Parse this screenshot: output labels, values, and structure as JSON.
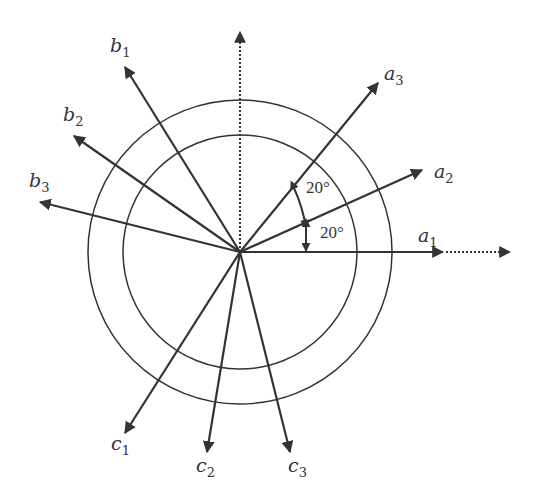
{
  "diagram": {
    "center": [
      240,
      252
    ],
    "circles": {
      "outer_radius": 152,
      "inner_radius": 117
    },
    "reference_axis_vertical": {
      "style": "dotted",
      "tip": [
        240,
        30
      ]
    },
    "reference_axis_horizontal": {
      "style": "dotted",
      "from": [
        443,
        252
      ],
      "tip": [
        510,
        252
      ]
    },
    "vectors": [
      {
        "id": "a1",
        "base": "a",
        "sub": "1",
        "tip": [
          443,
          252
        ],
        "label_pos": [
          418,
          244
        ]
      },
      {
        "id": "a2",
        "base": "a",
        "sub": "2",
        "tip": [
          422,
          170
        ],
        "label_pos": [
          434,
          178
        ]
      },
      {
        "id": "a3",
        "base": "a",
        "sub": "3",
        "tip": [
          378,
          83
        ],
        "label_pos": [
          384,
          82
        ]
      },
      {
        "id": "b1",
        "base": "b",
        "sub": "1",
        "tip": [
          125,
          67
        ],
        "label_pos": [
          110,
          52
        ]
      },
      {
        "id": "b2",
        "base": "b",
        "sub": "2",
        "tip": [
          74,
          136
        ],
        "label_pos": [
          63,
          121
        ]
      },
      {
        "id": "b3",
        "base": "b",
        "sub": "3",
        "tip": [
          40,
          202
        ],
        "label_pos": [
          29,
          185
        ]
      },
      {
        "id": "c1",
        "base": "c",
        "sub": "1",
        "tip": [
          125,
          433
        ],
        "label_pos": [
          111,
          457
        ]
      },
      {
        "id": "c2",
        "base": "c",
        "sub": "2",
        "tip": [
          207,
          452
        ],
        "label_pos": [
          196,
          478
        ]
      },
      {
        "id": "c3",
        "base": "c",
        "sub": "3",
        "tip": [
          290,
          452
        ],
        "label_pos": [
          288,
          478
        ]
      }
    ],
    "angles": [
      {
        "label": "20°",
        "between": [
          "a2",
          "a3"
        ]
      },
      {
        "label": "20°",
        "between": [
          "a1",
          "a2"
        ]
      }
    ],
    "colors": {
      "stroke": "#333333",
      "background": "#ffffff"
    }
  }
}
